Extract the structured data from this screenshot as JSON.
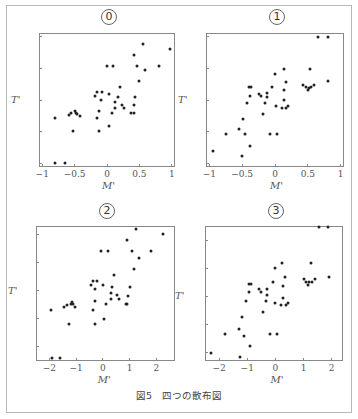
{
  "caption": "図5　四つの散布図",
  "chart_data": [
    {
      "type": "scatter",
      "title": "⓪",
      "xlabel": "M'",
      "ylabel": "T'",
      "xlim": [
        -1.05,
        1.05
      ],
      "ylim": [
        -1.05,
        1.05
      ],
      "xticks": [
        -1,
        -0.5,
        0,
        0.5,
        1
      ],
      "xtick_labels": [
        "−1",
        "−0.5",
        "0",
        "0.5",
        "1"
      ],
      "yticks": [
        -1,
        -0.5,
        0,
        0.5,
        1
      ],
      "ytick_labels": [
        "−1",
        "−0.5",
        "0",
        "0.5",
        "1"
      ],
      "grid": false,
      "points": [
        [
          -0.8,
          -0.98
        ],
        [
          -0.65,
          -0.98
        ],
        [
          -0.8,
          -0.28
        ],
        [
          -0.58,
          -0.24
        ],
        [
          -0.55,
          -0.2
        ],
        [
          -0.5,
          -0.17
        ],
        [
          -0.48,
          -0.2
        ],
        [
          -0.47,
          -0.22
        ],
        [
          -0.42,
          -0.25
        ],
        [
          -0.52,
          -0.49
        ],
        [
          -0.18,
          0.07
        ],
        [
          -0.15,
          0.12
        ],
        [
          -0.07,
          0.12
        ],
        [
          -0.12,
          -0.17
        ],
        [
          -0.15,
          -0.28
        ],
        [
          -0.1,
          0.0
        ],
        [
          -0.12,
          -0.49
        ],
        [
          0.0,
          0.54
        ],
        [
          0.1,
          0.54
        ],
        [
          0.03,
          0.09
        ],
        [
          0.07,
          -0.2
        ],
        [
          0.03,
          -0.41
        ],
        [
          0.13,
          -0.03
        ],
        [
          0.13,
          -0.12
        ],
        [
          0.17,
          0.04
        ],
        [
          0.2,
          0.2
        ],
        [
          0.23,
          -0.08
        ],
        [
          0.27,
          -0.12
        ],
        [
          0.37,
          -0.2
        ],
        [
          0.41,
          -0.2
        ],
        [
          0.42,
          -0.08
        ],
        [
          0.44,
          0.05
        ],
        [
          0.42,
          0.7
        ],
        [
          0.47,
          0.54
        ],
        [
          0.5,
          0.3
        ],
        [
          0.55,
          0.87
        ],
        [
          0.58,
          0.47
        ],
        [
          0.8,
          0.54
        ],
        [
          0.98,
          0.8
        ]
      ]
    },
    {
      "type": "scatter",
      "title": "①",
      "xlabel": "M'",
      "ylabel": "T'",
      "xlim": [
        -1.05,
        1.05
      ],
      "ylim": [
        -1.05,
        1.05
      ],
      "xticks": [
        -1,
        -0.5,
        0,
        0.5,
        1
      ],
      "xtick_labels": [
        "−1",
        "−0.5",
        "0",
        "0.5",
        "1"
      ],
      "yticks": [
        -1,
        -0.5,
        0,
        0.5,
        1
      ],
      "ytick_labels": [
        "−1",
        "−0.5",
        "0",
        "0.5",
        "1"
      ],
      "grid": false,
      "points": [
        [
          -0.95,
          -0.8
        ],
        [
          -0.75,
          -0.53
        ],
        [
          -0.55,
          -0.45
        ],
        [
          -0.5,
          -0.87
        ],
        [
          -0.48,
          -0.3
        ],
        [
          -0.45,
          -0.53
        ],
        [
          -0.42,
          -0.05
        ],
        [
          -0.38,
          -0.72
        ],
        [
          -0.4,
          0.2
        ],
        [
          -0.36,
          0.2
        ],
        [
          -0.38,
          0.07
        ],
        [
          -0.25,
          0.1
        ],
        [
          -0.22,
          0.07
        ],
        [
          -0.18,
          -0.22
        ],
        [
          -0.15,
          -0.05
        ],
        [
          -0.12,
          0.11
        ],
        [
          -0.12,
          0.04
        ],
        [
          -0.08,
          -0.53
        ],
        [
          -0.04,
          0.2
        ],
        [
          0.0,
          0.4
        ],
        [
          0.01,
          -0.09
        ],
        [
          0.03,
          -0.53
        ],
        [
          0.1,
          -0.13
        ],
        [
          0.13,
          0.48
        ],
        [
          0.13,
          0.15
        ],
        [
          0.13,
          0.0
        ],
        [
          0.17,
          0.28
        ],
        [
          0.17,
          -0.13
        ],
        [
          0.2,
          -0.1
        ],
        [
          0.43,
          0.23
        ],
        [
          0.47,
          0.2
        ],
        [
          0.5,
          0.15
        ],
        [
          0.51,
          0.19
        ],
        [
          0.53,
          0.48
        ],
        [
          0.55,
          0.2
        ],
        [
          0.6,
          0.23
        ],
        [
          0.66,
          0.98
        ],
        [
          0.8,
          0.98
        ],
        [
          0.8,
          0.29
        ]
      ]
    },
    {
      "type": "scatter",
      "title": "②",
      "xlabel": "M'",
      "ylabel": "T'",
      "xlim": [
        -2.5,
        2.7
      ],
      "ylim": [
        -2.5,
        2.3
      ],
      "xticks": [
        -2,
        -1,
        0,
        1,
        2
      ],
      "xtick_labels": [
        "−2",
        "−1",
        "0",
        "1",
        "2"
      ],
      "yticks": [
        -2,
        -1,
        0,
        1,
        2
      ],
      "ytick_labels": [
        "−2",
        "−1",
        "0",
        "1",
        "2"
      ],
      "grid": false,
      "points": [
        [
          -1.95,
          -0.7
        ],
        [
          -1.9,
          -2.4
        ],
        [
          -1.6,
          -2.4
        ],
        [
          -1.45,
          -0.58
        ],
        [
          -1.35,
          -0.5
        ],
        [
          -1.25,
          -1.2
        ],
        [
          -1.2,
          -0.48
        ],
        [
          -1.15,
          -0.4
        ],
        [
          -1.1,
          -0.48
        ],
        [
          -1.05,
          -0.58
        ],
        [
          -0.45,
          0.22
        ],
        [
          -0.35,
          0.35
        ],
        [
          -0.35,
          -0.68
        ],
        [
          -0.28,
          0.05
        ],
        [
          -0.28,
          -0.35
        ],
        [
          -0.28,
          -1.2
        ],
        [
          -0.2,
          0.35
        ],
        [
          -0.05,
          1.4
        ],
        [
          0.0,
          0.22
        ],
        [
          0.05,
          -1.0
        ],
        [
          0.1,
          -0.47
        ],
        [
          0.2,
          1.4
        ],
        [
          0.3,
          -0.28
        ],
        [
          0.3,
          -0.08
        ],
        [
          0.35,
          0.13
        ],
        [
          0.42,
          0.55
        ],
        [
          0.52,
          -0.15
        ],
        [
          0.6,
          -0.28
        ],
        [
          0.85,
          -0.47
        ],
        [
          0.92,
          -0.47
        ],
        [
          0.92,
          1.82
        ],
        [
          0.93,
          -0.18
        ],
        [
          1.02,
          0.13
        ],
        [
          1.1,
          1.4
        ],
        [
          1.15,
          0.78
        ],
        [
          1.25,
          2.2
        ],
        [
          1.35,
          1.18
        ],
        [
          1.8,
          1.4
        ],
        [
          2.25,
          2.03
        ]
      ]
    },
    {
      "type": "scatter",
      "title": "③",
      "xlabel": "M'",
      "ylabel": "T'",
      "xlim": [
        -2.5,
        2.4
      ],
      "ylim": [
        -2.3,
        2.5
      ],
      "xticks": [
        -2,
        -1,
        0,
        1,
        2
      ],
      "xtick_labels": [
        "−2",
        "−1",
        "0",
        "1",
        "2"
      ],
      "yticks": [
        -2,
        -1,
        0,
        1,
        2
      ],
      "ytick_labels": [
        "−2",
        "−1",
        "0",
        "1",
        "2"
      ],
      "grid": false,
      "points": [
        [
          -2.3,
          -2.0
        ],
        [
          -1.8,
          -1.35
        ],
        [
          -1.3,
          -1.15
        ],
        [
          -1.2,
          -0.75
        ],
        [
          -1.25,
          -2.15
        ],
        [
          -1.1,
          -1.4
        ],
        [
          -1.05,
          -0.15
        ],
        [
          -0.95,
          0.45
        ],
        [
          -0.95,
          0.15
        ],
        [
          -0.9,
          -1.75
        ],
        [
          -0.85,
          0.45
        ],
        [
          -0.6,
          0.25
        ],
        [
          -0.5,
          0.15
        ],
        [
          -0.45,
          -0.55
        ],
        [
          -0.35,
          -0.15
        ],
        [
          -0.3,
          0.25
        ],
        [
          -0.3,
          0.05
        ],
        [
          -0.2,
          -1.35
        ],
        [
          -0.1,
          0.5
        ],
        [
          0.0,
          1.0
        ],
        [
          0.0,
          -0.25
        ],
        [
          0.05,
          -1.35
        ],
        [
          0.2,
          -0.3
        ],
        [
          0.25,
          1.2
        ],
        [
          0.27,
          0.37
        ],
        [
          0.28,
          -0.05
        ],
        [
          0.35,
          0.7
        ],
        [
          0.38,
          -0.3
        ],
        [
          0.45,
          -0.25
        ],
        [
          1.0,
          0.6
        ],
        [
          1.1,
          0.5
        ],
        [
          1.15,
          0.4
        ],
        [
          1.2,
          0.5
        ],
        [
          1.25,
          1.2
        ],
        [
          1.3,
          0.5
        ],
        [
          1.4,
          0.6
        ],
        [
          1.55,
          2.45
        ],
        [
          1.85,
          2.45
        ],
        [
          1.9,
          0.7
        ]
      ]
    }
  ]
}
